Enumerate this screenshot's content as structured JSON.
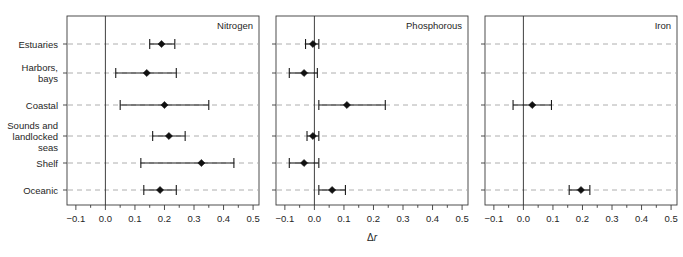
{
  "figure": {
    "xlabel": "Δr",
    "xlabel_delta": "Δ",
    "xlabel_var": "r",
    "categories": [
      "Estuaries",
      "Harbors, bays",
      "Coastal",
      "Sounds and landlocked seas",
      "Shelf",
      "Oceanic"
    ],
    "category_lines": [
      [
        "Estuaries"
      ],
      [
        "Harbors,",
        "bays"
      ],
      [
        "Coastal"
      ],
      [
        "Sounds and",
        "landlocked",
        "seas"
      ],
      [
        "Shelf"
      ],
      [
        "Oceanic"
      ]
    ],
    "xticks": [
      -0.1,
      0.0,
      0.1,
      0.2,
      0.3,
      0.4,
      0.5
    ],
    "xtick_labels": [
      "−0.1",
      "0.0",
      "0.1",
      "0.2",
      "0.3",
      "0.4",
      "0.5"
    ],
    "xlim": [
      -0.13,
      0.52
    ],
    "minor_tick_step": 0.05,
    "colors": {
      "marker": "#101010",
      "line": "#1a1a1a",
      "grid": "#9a9a9a",
      "frame": "#3a3a3a",
      "zero": "#2b2b2b",
      "text": "#262626",
      "background": "#ffffff"
    }
  },
  "chart_data": {
    "type": "scatter",
    "title": "",
    "xlabel": "Δr",
    "ylabel": "",
    "xlim": [
      -0.13,
      0.52
    ],
    "grid": true,
    "legend": "none",
    "categories": [
      "Estuaries",
      "Harbors, bays",
      "Coastal",
      "Sounds and landlocked seas",
      "Shelf",
      "Oceanic"
    ],
    "panels": [
      {
        "name": "Nitrogen",
        "points": [
          {
            "category": "Estuaries",
            "value": 0.19,
            "low": 0.15,
            "high": 0.235
          },
          {
            "category": "Harbors, bays",
            "value": 0.14,
            "low": 0.035,
            "high": 0.24
          },
          {
            "category": "Coastal",
            "value": 0.2,
            "low": 0.05,
            "high": 0.35
          },
          {
            "category": "Sounds and landlocked seas",
            "value": 0.215,
            "low": 0.16,
            "high": 0.27
          },
          {
            "category": "Shelf",
            "value": 0.325,
            "low": 0.12,
            "high": 0.435
          },
          {
            "category": "Oceanic",
            "value": 0.185,
            "low": 0.13,
            "high": 0.24
          }
        ]
      },
      {
        "name": "Phosphorous",
        "points": [
          {
            "category": "Estuaries",
            "value": -0.005,
            "low": -0.03,
            "high": 0.015
          },
          {
            "category": "Harbors, bays",
            "value": -0.035,
            "low": -0.085,
            "high": 0.01
          },
          {
            "category": "Coastal",
            "value": 0.11,
            "low": 0.015,
            "high": 0.24
          },
          {
            "category": "Sounds and landlocked seas",
            "value": -0.005,
            "low": -0.025,
            "high": 0.015
          },
          {
            "category": "Shelf",
            "value": -0.035,
            "low": -0.085,
            "high": 0.015
          },
          {
            "category": "Oceanic",
            "value": 0.06,
            "low": 0.015,
            "high": 0.105
          }
        ]
      },
      {
        "name": "Iron",
        "points": [
          {
            "category": "Coastal",
            "value": 0.03,
            "low": -0.035,
            "high": 0.095
          },
          {
            "category": "Oceanic",
            "value": 0.195,
            "low": 0.155,
            "high": 0.225
          }
        ]
      }
    ]
  }
}
